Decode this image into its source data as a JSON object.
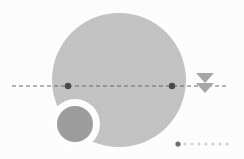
{
  "canvas": {
    "width": 244,
    "height": 159,
    "background_color": "#fefefe"
  },
  "palette": {
    "large_disc": "#c4c4c4",
    "small_disc": "#9e9e9e",
    "ring_white": "#ffffff",
    "axis_line": "#6b6b6b",
    "axis_marker": "#4a4a4a",
    "cursor_arrow": "#a8a8a8",
    "pager_active": "#6e6e6e",
    "pager_inactive": "#d2d2d2"
  },
  "shapes": {
    "large_disc": {
      "name": "large-gray-disc",
      "cx": 119,
      "cy": 80,
      "r": 67,
      "fill": "#c4c4c4"
    },
    "small_disc": {
      "name": "small-gray-disc",
      "cx": 75,
      "cy": 124,
      "r": 18,
      "fill": "#9e9e9e"
    },
    "cutout_ring": {
      "name": "white-cutout-ring",
      "cx": 75,
      "cy": 124,
      "r": 25,
      "fill": "#ffffff"
    }
  },
  "axis": {
    "name": "horizontal-dashed-axis",
    "y": 86,
    "x_start": 12,
    "x_end": 228,
    "dash_pattern": "4 3",
    "stroke_width": 1,
    "color": "#6b6b6b",
    "markers": [
      {
        "label": "left-intersection-marker",
        "x": 68,
        "y": 86,
        "r": 3.2
      },
      {
        "label": "right-intersection-marker",
        "x": 172,
        "y": 86,
        "r": 3.2
      }
    ]
  },
  "cursor": {
    "name": "double-down-arrow-cursor",
    "x": 205,
    "color": "#a8a8a8",
    "triangles": [
      {
        "label": "upper-triangle",
        "cy": 78,
        "half_width": 9,
        "height": 10
      },
      {
        "label": "lower-triangle",
        "cy": 88,
        "half_width": 9,
        "height": 10
      }
    ]
  },
  "pager": {
    "name": "carousel-page-indicator",
    "y": 144,
    "x_start": 178,
    "spacing": 7,
    "active_index": 0,
    "active_radius": 2.6,
    "inactive_radius": 1.5,
    "dots": [
      {
        "index": 0,
        "state": "active"
      },
      {
        "index": 1,
        "state": "inactive"
      },
      {
        "index": 2,
        "state": "inactive"
      },
      {
        "index": 3,
        "state": "inactive"
      },
      {
        "index": 4,
        "state": "inactive"
      },
      {
        "index": 5,
        "state": "inactive"
      },
      {
        "index": 6,
        "state": "inactive"
      },
      {
        "index": 7,
        "state": "inactive"
      }
    ]
  }
}
